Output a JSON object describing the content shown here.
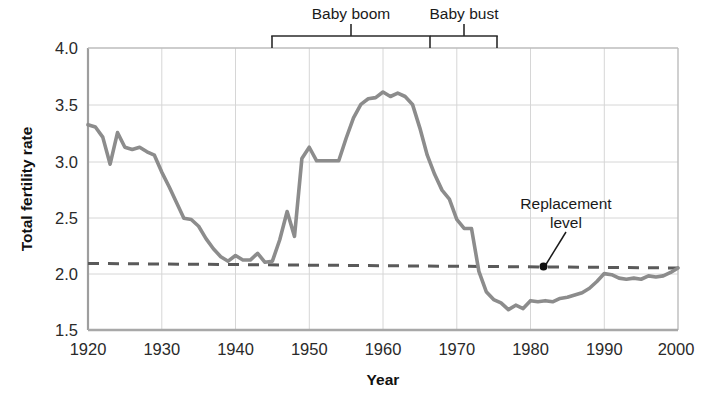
{
  "chart_data": {
    "type": "line",
    "title": "",
    "xlabel": "Year",
    "ylabel": "Total fertility rate",
    "xlim": [
      1920,
      2000
    ],
    "ylim": [
      1.5,
      4.0
    ],
    "xticks": [
      1920,
      1930,
      1940,
      1950,
      1960,
      1970,
      1980,
      1990,
      2000
    ],
    "yticks": [
      "4.0",
      "3.5",
      "3.0",
      "2.5",
      "2.0",
      "1.5"
    ],
    "ytick_values": [
      4.0,
      3.5,
      3.0,
      2.5,
      2.0,
      1.5
    ],
    "grid": true,
    "legend": "none",
    "series": [
      {
        "name": "Total fertility rate",
        "color": "#8c8c8c",
        "x": [
          1920,
          1921,
          1922,
          1923,
          1924,
          1925,
          1926,
          1927,
          1928,
          1929,
          1930,
          1931,
          1932,
          1933,
          1934,
          1935,
          1936,
          1937,
          1938,
          1939,
          1940,
          1941,
          1942,
          1943,
          1944,
          1945,
          1946,
          1947,
          1948,
          1949,
          1950,
          1951,
          1952,
          1953,
          1954,
          1955,
          1956,
          1957,
          1958,
          1959,
          1960,
          1961,
          1962,
          1963,
          1964,
          1965,
          1966,
          1967,
          1968,
          1969,
          1970,
          1971,
          1972,
          1973,
          1974,
          1975,
          1976,
          1977,
          1978,
          1979,
          1980,
          1981,
          1982,
          1983,
          1984,
          1985,
          1986,
          1987,
          1988,
          1989,
          1990,
          1991,
          1992,
          1993,
          1994,
          1995,
          1996,
          1997,
          1998,
          1999,
          2000
        ],
        "y": [
          3.32,
          3.3,
          3.21,
          2.97,
          3.25,
          3.12,
          3.1,
          3.12,
          3.08,
          3.05,
          2.9,
          2.77,
          2.63,
          2.49,
          2.48,
          2.42,
          2.31,
          2.22,
          2.15,
          2.11,
          2.16,
          2.12,
          2.12,
          2.18,
          2.1,
          2.11,
          2.3,
          2.55,
          2.33,
          3.02,
          3.12,
          3.0,
          3.0,
          3.0,
          3.0,
          3.2,
          3.38,
          3.5,
          3.55,
          3.56,
          3.61,
          3.57,
          3.6,
          3.57,
          3.5,
          3.29,
          3.05,
          2.88,
          2.74,
          2.66,
          2.48,
          2.4,
          2.4,
          2.02,
          1.84,
          1.77,
          1.74,
          1.68,
          1.72,
          1.69,
          1.76,
          1.75,
          1.76,
          1.75,
          1.78,
          1.79,
          1.81,
          1.83,
          1.87,
          1.93,
          2.0,
          1.99,
          1.96,
          1.95,
          1.96,
          1.95,
          1.98,
          1.97,
          1.98,
          2.01,
          2.05
        ]
      }
    ],
    "reference_lines": [
      {
        "name": "replacement-level",
        "label": "Replacement\nlevel",
        "label_line1": "Replacement",
        "label_line2": "level",
        "style": "dashed",
        "color": "#5a5a5a",
        "y_start": 2.09,
        "y_end": 2.05,
        "marker_year": 1982,
        "marker_value": 2.06
      }
    ],
    "annotations": [
      {
        "name": "baby-boom-bracket",
        "label": "Baby boom",
        "x_start": 1945,
        "x_end": 1966,
        "tick_at": 1955.5
      },
      {
        "name": "baby-bust-bracket",
        "label": "Baby bust",
        "x_start": 1966,
        "x_end": 1975,
        "tick_at": 1971
      }
    ],
    "colors": {
      "line": "#8c8c8c",
      "grid": "#d4d4d4",
      "axis": "#b0b0b0",
      "dashed": "#5a5a5a",
      "text": "#1a1a1a"
    }
  }
}
